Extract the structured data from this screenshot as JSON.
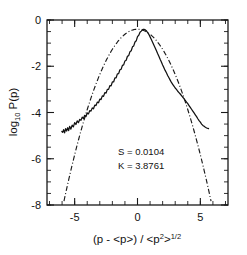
{
  "chart_data": {
    "type": "line",
    "title": "",
    "xlabel": "(p - <p>) / <p2>1/2",
    "xlabel_parts": {
      "main1": "(p - <p>) / <p",
      "sup1": "2",
      "main2": ">",
      "sup2": "1/2"
    },
    "ylabel": "log10 P(p)",
    "ylabel_parts": {
      "main1": "log",
      "sub1": "10",
      "main2": " P(p)"
    },
    "xlim": [
      -7.2,
      7.2
    ],
    "ylim": [
      -8,
      0
    ],
    "xticks_major": [
      -5,
      0,
      5
    ],
    "xticks_major_labels": [
      "-5",
      "0",
      "5"
    ],
    "xtick_minor_step": 1,
    "yticks_major": [
      0,
      -2,
      -4,
      -6,
      -8
    ],
    "yticks_major_labels": [
      "0",
      "-2",
      "-4",
      "-6",
      "-8"
    ],
    "ytick_minor_step": 0.5,
    "grid": false,
    "legend_position": "none",
    "annotations": [
      {
        "text": "S = 0.0104",
        "x": 0.2,
        "y": -5.85
      },
      {
        "text": "K = 3.8761",
        "x": 0.2,
        "y": -6.45
      }
    ],
    "series": [
      {
        "name": "measured-pdf",
        "style": "solid-noisy",
        "x": [
          -6.02,
          -5.95,
          -5.88,
          -5.8,
          -5.72,
          -5.64,
          -5.56,
          -5.48,
          -5.4,
          -5.3,
          -5.2,
          -5.1,
          -5.0,
          -4.9,
          -4.8,
          -4.7,
          -4.6,
          -4.5,
          -4.4,
          -4.3,
          -4.2,
          -4.1,
          -4.0,
          -3.9,
          -3.8,
          -3.7,
          -3.6,
          -3.5,
          -3.4,
          -3.3,
          -3.2,
          -3.1,
          -3.0,
          -2.9,
          -2.8,
          -2.7,
          -2.6,
          -2.5,
          -2.4,
          -2.3,
          -2.2,
          -2.1,
          -2.0,
          -1.9,
          -1.8,
          -1.7,
          -1.6,
          -1.5,
          -1.4,
          -1.3,
          -1.2,
          -1.1,
          -1.0,
          -0.9,
          -0.8,
          -0.7,
          -0.6,
          -0.5,
          -0.4,
          -0.3,
          -0.2,
          -0.1,
          0.0,
          0.1,
          0.2,
          0.3,
          0.4,
          0.5,
          0.6,
          0.7,
          0.8,
          0.9,
          1.0,
          1.1,
          1.2,
          1.3,
          1.4,
          1.5,
          1.6,
          1.7,
          1.8,
          1.9,
          2.0,
          2.1,
          2.2,
          2.3,
          2.4,
          2.5,
          2.6,
          2.7,
          2.8,
          2.9,
          3.0,
          3.1,
          3.2,
          3.3,
          3.4,
          3.5,
          3.6,
          3.7,
          3.8,
          3.9,
          4.0,
          4.1,
          4.2,
          4.3,
          4.4,
          4.5,
          4.6,
          4.7,
          4.8,
          4.9,
          5.0,
          5.1,
          5.2,
          5.3,
          5.4,
          5.5,
          5.6,
          5.65
        ],
        "y": [
          -4.82,
          -4.86,
          -4.74,
          -4.88,
          -4.7,
          -4.8,
          -4.66,
          -4.78,
          -4.6,
          -4.72,
          -4.55,
          -4.62,
          -4.44,
          -4.52,
          -4.36,
          -4.44,
          -4.3,
          -4.34,
          -4.2,
          -4.26,
          -4.12,
          -4.18,
          -4.02,
          -4.06,
          -3.92,
          -3.94,
          -3.8,
          -3.84,
          -3.68,
          -3.7,
          -3.55,
          -3.58,
          -3.42,
          -3.44,
          -3.28,
          -3.3,
          -3.14,
          -3.16,
          -3.0,
          -3.0,
          -2.84,
          -2.85,
          -2.68,
          -2.68,
          -2.5,
          -2.5,
          -2.33,
          -2.32,
          -2.15,
          -2.13,
          -1.96,
          -1.94,
          -1.77,
          -1.74,
          -1.57,
          -1.54,
          -1.37,
          -1.33,
          -1.16,
          -1.12,
          -0.95,
          -0.9,
          -0.72,
          -0.66,
          -0.53,
          -0.48,
          -0.42,
          -0.4,
          -0.42,
          -0.46,
          -0.54,
          -0.62,
          -0.73,
          -0.84,
          -0.96,
          -1.08,
          -1.2,
          -1.32,
          -1.45,
          -1.57,
          -1.7,
          -1.82,
          -1.95,
          -2.06,
          -2.18,
          -2.28,
          -2.4,
          -2.5,
          -2.6,
          -2.7,
          -2.78,
          -2.86,
          -2.94,
          -3.0,
          -3.08,
          -3.14,
          -3.2,
          -3.27,
          -3.34,
          -3.4,
          -3.48,
          -3.55,
          -3.62,
          -3.7,
          -3.78,
          -3.86,
          -3.94,
          -4.02,
          -4.1,
          -4.18,
          -4.27,
          -4.35,
          -4.42,
          -4.5,
          -4.56,
          -4.6,
          -4.64,
          -4.67,
          -4.69,
          -4.7
        ]
      },
      {
        "name": "gaussian-fit",
        "style": "dash-dot",
        "description": "Gaussian reference curve log10 P = -0.4 - x^2/(2 ln10)",
        "x_range": [
          -5.85,
          5.85
        ],
        "peak_y": -0.4
      }
    ]
  },
  "figure": {
    "background_color": "#ffffff",
    "foreground_color": "#111111"
  }
}
